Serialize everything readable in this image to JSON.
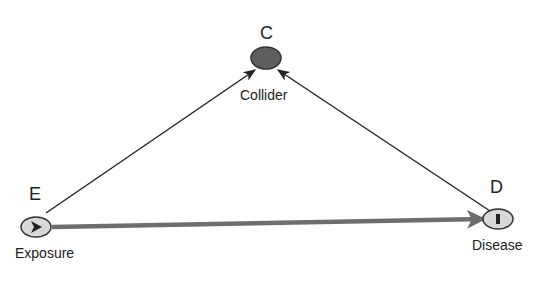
{
  "diagram": {
    "type": "causal DAG",
    "nodes": [
      {
        "id": "E",
        "letter": "E",
        "name": "Exposure",
        "icon": "play-triangle-icon",
        "fill": "#d8d8d8"
      },
      {
        "id": "C",
        "letter": "C",
        "name": "Collider",
        "icon": "none",
        "fill": "#5e5e5e"
      },
      {
        "id": "D",
        "letter": "D",
        "name": "Disease",
        "icon": "bar-icon",
        "fill": "#d8d8d8"
      }
    ],
    "edges": [
      {
        "from": "E",
        "to": "C",
        "style": "thin",
        "color": "#222222"
      },
      {
        "from": "D",
        "to": "C",
        "style": "thin",
        "color": "#222222"
      },
      {
        "from": "E",
        "to": "D",
        "style": "thick",
        "color": "#6e6e6e"
      }
    ]
  }
}
